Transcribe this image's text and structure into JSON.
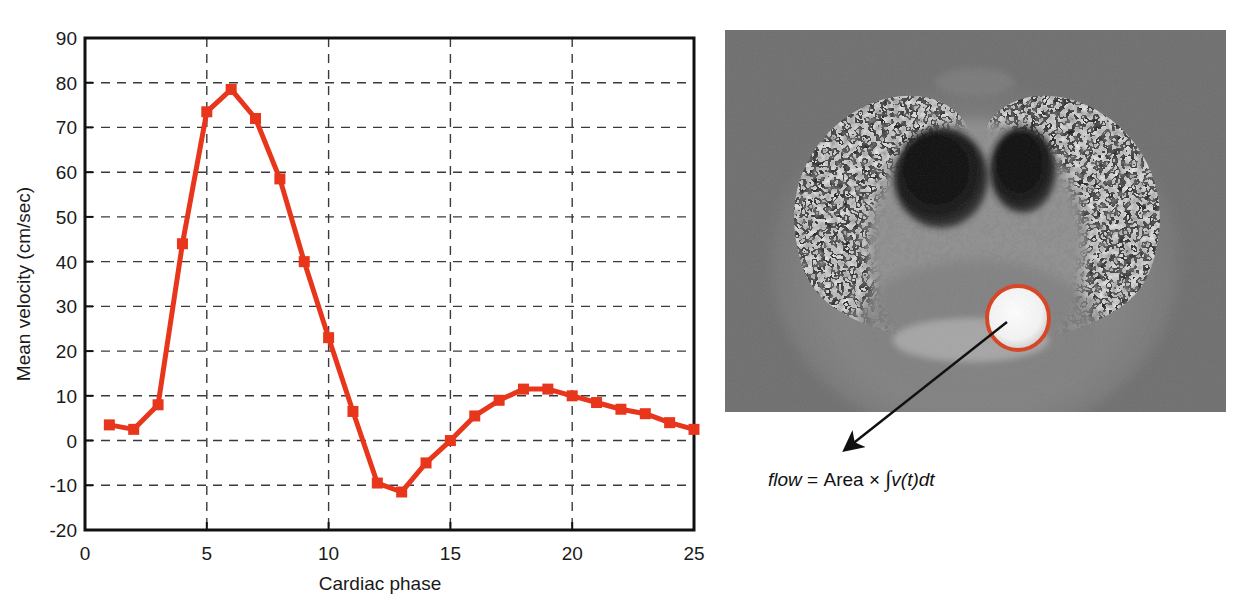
{
  "chart_data": {
    "type": "line",
    "title": "",
    "xlabel": "Cardiac phase",
    "ylabel": "Mean velocity (cm/sec)",
    "xlim": [
      0,
      25
    ],
    "ylim": [
      -20,
      90
    ],
    "xticks": [
      0,
      5,
      10,
      15,
      20,
      25
    ],
    "yticks": [
      -20,
      -10,
      0,
      10,
      20,
      30,
      40,
      50,
      60,
      70,
      80,
      90
    ],
    "xtick_labels": [
      "0",
      "5",
      "10",
      "15",
      "20",
      "25"
    ],
    "ytick_labels": [
      "-20",
      "-10",
      "0",
      "10",
      "20",
      "30",
      "40",
      "50",
      "60",
      "70",
      "80",
      "90"
    ],
    "grid": true,
    "grid_style": "dashed",
    "legend": "none",
    "series_color": "#E8361C",
    "marker": "square",
    "x": [
      1,
      2,
      3,
      4,
      5,
      6,
      7,
      8,
      9,
      10,
      11,
      12,
      13,
      14,
      15,
      16,
      17,
      18,
      19,
      20,
      21,
      22,
      23,
      24,
      25
    ],
    "values": [
      3.5,
      2.5,
      8.0,
      44.0,
      73.5,
      78.5,
      72.0,
      58.5,
      40.0,
      23.0,
      6.5,
      -9.5,
      -11.5,
      -5.0,
      0.0,
      5.5,
      9.0,
      11.5,
      11.5,
      10.0,
      8.5,
      7.0,
      6.0,
      4.0,
      2.5
    ],
    "series": [
      {
        "name": "Mean velocity",
        "values": [
          3.5,
          2.5,
          8.0,
          44.0,
          73.5,
          78.5,
          72.0,
          58.5,
          40.0,
          23.0,
          6.5,
          -9.5,
          -11.5,
          -5.0,
          0.0,
          5.5,
          9.0,
          11.5,
          11.5,
          10.0,
          8.5,
          7.0,
          6.0,
          4.0,
          2.5
        ]
      }
    ]
  },
  "chart": {
    "x_axis_title": "Cardiac phase",
    "y_axis_title": "Mean velocity (cm/sec)"
  },
  "image_panel": {
    "caption": {
      "flow_term": "flow",
      "equals": "=",
      "area_term": "Area",
      "times": "×",
      "integral": "∫",
      "integrand": "v(t)dt",
      "full_text": "flow = Area × ∫v(t)dt"
    },
    "roi": {
      "label": "region-of-interest",
      "color": "#D8401E"
    },
    "arrow": {
      "label": "roi-pointer-arrow",
      "color": "#111111"
    },
    "modality": "phase-contrast-mr-image"
  },
  "colors": {
    "series_red": "#E8361C",
    "roi_red": "#D8401E",
    "axis_black": "#111111",
    "grid_gray": "#4d4d4d",
    "image_bg": "#6e6e6e"
  }
}
